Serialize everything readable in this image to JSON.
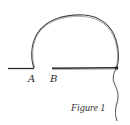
{
  "figure": {
    "caption": "Figure 1",
    "labels": {
      "a": "A",
      "b": "B"
    },
    "colors": {
      "stroke": "#2b2b2b",
      "stroke_light": "#6a6a6a",
      "background": "#ffffff"
    }
  }
}
